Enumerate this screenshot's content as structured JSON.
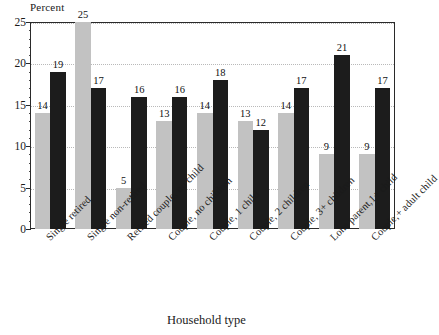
{
  "chart_data": {
    "type": "bar",
    "title": "",
    "xlabel": "Household type",
    "ylabel": "Percent",
    "ylim": [
      0,
      25
    ],
    "yticks": [
      0,
      5,
      10,
      15,
      20,
      25
    ],
    "grid": true,
    "grid_style": "dotted-horizontal",
    "legend": null,
    "minor_tick_step": 1,
    "categories": [
      "Single retired",
      "Single non-retired",
      "Retired couple, no child",
      "Couple, no children",
      "Couple, 1 child",
      "Couple, 2 children",
      "Couple, 3+ children",
      "Lone parent,1+ child",
      "Couple,+ adult child"
    ],
    "series": [
      {
        "name": "series-light",
        "color": "#c2c2c2",
        "values": [
          14,
          25,
          5,
          13,
          14,
          13,
          14,
          9,
          9
        ]
      },
      {
        "name": "series-dark",
        "color": "#1c1c1c",
        "values": [
          19,
          17,
          16,
          16,
          18,
          12,
          17,
          21,
          17
        ]
      }
    ]
  },
  "axis": {
    "y_title": "Percent",
    "x_title": "Household type",
    "y_tick_labels": [
      "0",
      "5",
      "10",
      "15",
      "20",
      "25"
    ]
  },
  "colors": {
    "light_bar": "#c2c2c2",
    "dark_bar": "#1c1c1c",
    "frame": "#2a2a2a",
    "gridline": "#b9b9b9",
    "background": "#ffffff",
    "text": "#1a1a1a"
  }
}
